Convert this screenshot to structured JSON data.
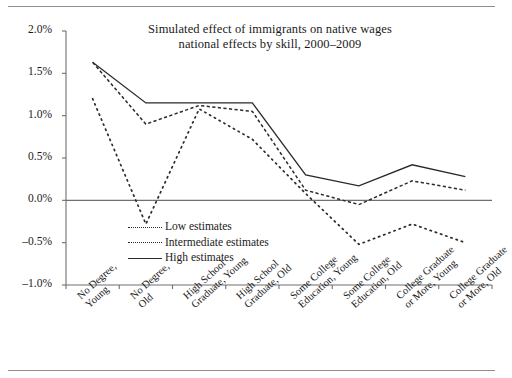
{
  "chart_data": {
    "type": "line",
    "title": "Simulated effect of immigrants on native wages",
    "subtitle": "national effects by skill, 2000–2009",
    "xlabel": "",
    "ylabel": "",
    "ylim": [
      -1.0,
      2.0
    ],
    "ytick_labels": [
      "2.0%",
      "1.5%",
      "1.0%",
      "0.5%",
      "0.0%",
      "–0.5%",
      "–1.0%"
    ],
    "ytick_values": [
      2.0,
      1.5,
      1.0,
      0.5,
      0.0,
      -0.5,
      -1.0
    ],
    "grid": false,
    "legend_position": "inside-lower-left",
    "categories": [
      "No Degree, Young",
      "No Degree, Old",
      "High School Graduate, Young",
      "High School Graduate, Old",
      "Some College Education, Young",
      "Some College Education, Old",
      "College Graduate or More, Young",
      "College Graduate or More, Old"
    ],
    "category_lines": [
      [
        "No Degree,",
        "Young"
      ],
      [
        "No Degree,",
        "Old"
      ],
      [
        "High School",
        "Graduate, Young"
      ],
      [
        "High School",
        "Graduate, Old"
      ],
      [
        "Some College",
        "Education, Young"
      ],
      [
        "Some College",
        "Education, Old"
      ],
      [
        "College Graduate",
        "or More, Young"
      ],
      [
        "College Graduate",
        "or More, Old"
      ]
    ],
    "series": [
      {
        "name": "Low estimates",
        "style": "dotted",
        "color": "#2a2a2a",
        "values": [
          1.2,
          -0.28,
          1.08,
          0.72,
          0.08,
          -0.52,
          -0.28,
          -0.5
        ]
      },
      {
        "name": "Intermediate estimates",
        "style": "dashed",
        "color": "#2a2a2a",
        "values": [
          1.63,
          0.9,
          1.12,
          1.05,
          0.12,
          -0.05,
          0.23,
          0.12
        ]
      },
      {
        "name": "High estimates",
        "style": "solid",
        "color": "#2a2a2a",
        "values": [
          1.63,
          1.15,
          1.15,
          1.15,
          0.3,
          0.17,
          0.42,
          0.28
        ]
      }
    ]
  },
  "legend": {
    "items": [
      {
        "label": "Low estimates"
      },
      {
        "label": "Intermediate estimates"
      },
      {
        "label": "High estimates"
      }
    ]
  }
}
